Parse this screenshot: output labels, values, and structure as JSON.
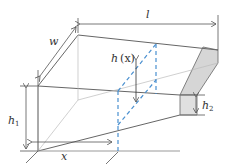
{
  "diagram": {
    "labels": {
      "length": "l",
      "width": "w",
      "height_var": "h",
      "height_var_arg": "(x)",
      "height_start": "h",
      "height_start_sub": "1",
      "height_end": "h",
      "height_end_sub": "2",
      "position": "x"
    },
    "colors": {
      "line": "#555555",
      "dashed_section": "#4a90d0",
      "end_face": "#d4d4d4",
      "background": "#ffffff"
    }
  }
}
